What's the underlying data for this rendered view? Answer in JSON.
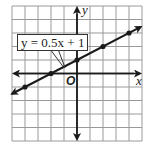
{
  "chart_data": {
    "type": "line",
    "title": "",
    "equation_label": "y = 0.5x + 1",
    "xlabel": "x",
    "ylabel": "y",
    "origin_label": "O",
    "xlim": [
      -5,
      5
    ],
    "ylim": [
      -5,
      5
    ],
    "grid": true,
    "series": [
      {
        "name": "y = 0.5x + 1",
        "slope": 0.5,
        "intercept": 1,
        "points": [
          [
            -4,
            -1
          ],
          [
            -2,
            0
          ],
          [
            0,
            1
          ],
          [
            2,
            2
          ],
          [
            4,
            3
          ]
        ]
      }
    ],
    "colors": {
      "grid": "#9a9a9a",
      "axis": "#1a1a1a",
      "line": "#1a1a1a"
    }
  },
  "labels": {
    "equation": "y = 0.5x + 1",
    "x_axis": "x",
    "y_axis": "y",
    "origin": "O"
  }
}
